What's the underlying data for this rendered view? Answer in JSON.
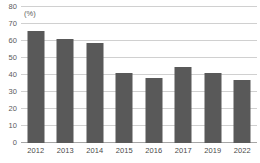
{
  "chart_data": {
    "type": "bar",
    "title": "",
    "subtitle": "",
    "unit_label": "(%)",
    "xlabel": "",
    "ylabel": "",
    "categories": [
      "2012",
      "2013",
      "2014",
      "2015",
      "2016",
      "2017",
      "2019",
      "2022"
    ],
    "values": [
      66,
      61,
      59,
      41,
      38,
      45,
      41,
      37
    ],
    "series": [
      {
        "name": "",
        "values": [
          66,
          61,
          59,
          41,
          38,
          45,
          41,
          37
        ]
      }
    ],
    "ylim": [
      0,
      80
    ],
    "ytick_values": [
      0,
      10,
      20,
      30,
      40,
      50,
      60,
      70,
      80
    ],
    "ytick_labels": [
      "0",
      "10",
      "20",
      "30",
      "40",
      "50",
      "60",
      "70",
      "80"
    ],
    "grid": true,
    "legend": false,
    "legend_position": "none",
    "annotations": [],
    "colors": {
      "bar": "#595959",
      "gridline": "#d0d0d0",
      "axis": "#a6a6a6",
      "tick_text": "#5a5a5a",
      "background": "#ffffff"
    }
  }
}
